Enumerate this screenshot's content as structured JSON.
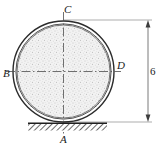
{
  "figure": {
    "labels": {
      "point_a": "A",
      "point_b": "B",
      "point_c": "C",
      "point_d": "D"
    },
    "dimension": {
      "value": "6",
      "orientation": "vertical",
      "arrow_style": "double-ended"
    },
    "colors": {
      "stroke": "#2b2b2b",
      "fill_inner": "#efefef",
      "stipple": "#8c8c8c",
      "ground_hatch": "#3a3a3a",
      "centerline": "#555555",
      "background": "#ffffff",
      "dimension_line": "#6b6b6b"
    },
    "geometry": {
      "center_x": 63.5,
      "center_y": 71.5,
      "outer_radius": 51,
      "inner_radius": 47,
      "ground_y": 123,
      "dimension_x": 148,
      "dimension_top_y": 20,
      "dimension_bottom_y": 122
    }
  }
}
